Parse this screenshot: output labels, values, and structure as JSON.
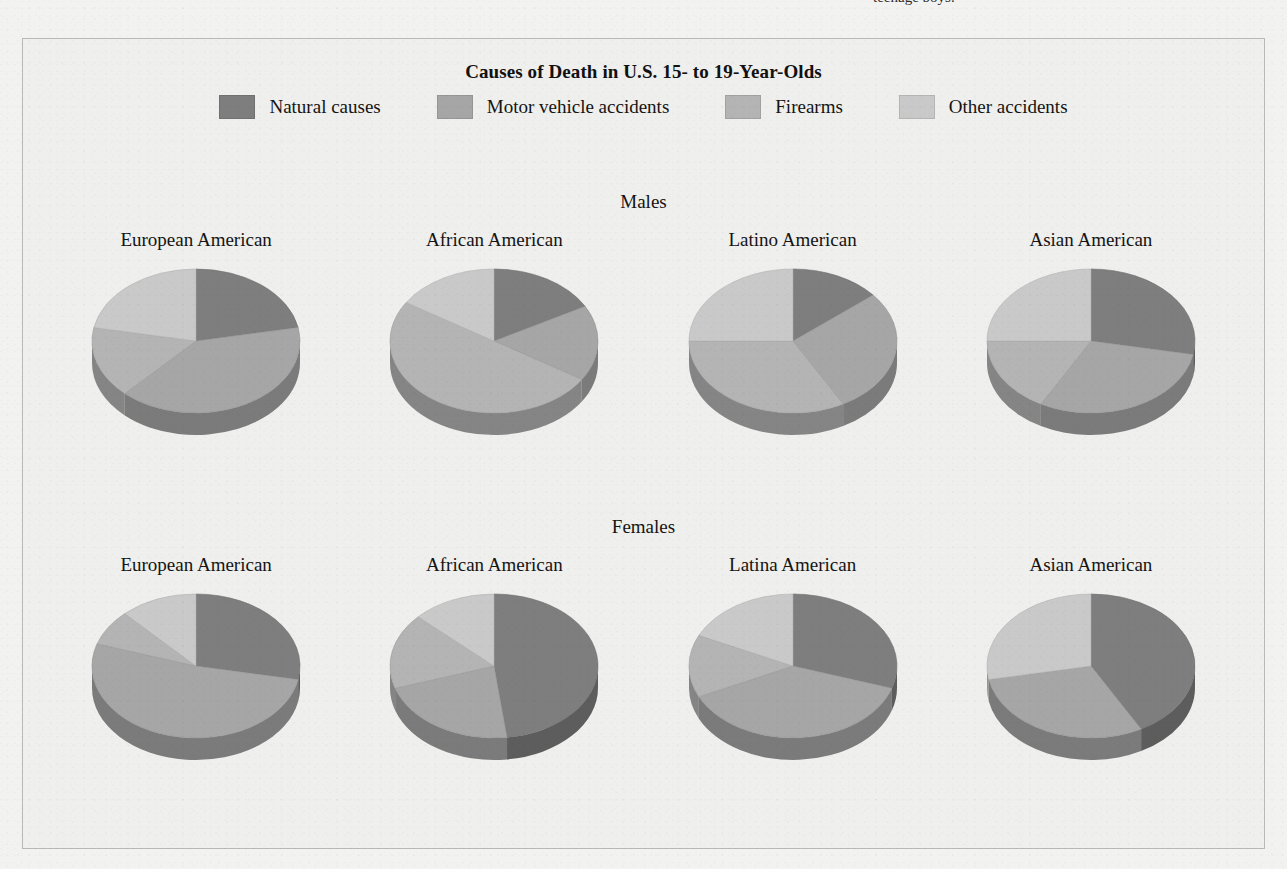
{
  "page": {
    "cut_off_caption": "teenage boys.",
    "background_color": "#f2f2f0",
    "panel_color": "#efefed"
  },
  "figure": {
    "title": "Causes of Death in U.S. 15- to 19-Year-Olds",
    "legend": [
      {
        "label": "Natural causes",
        "color": "#7e7e7e"
      },
      {
        "label": "Motor vehicle accidents",
        "color": "#a6a6a6"
      },
      {
        "label": "Firearms",
        "color": "#b4b4b4"
      },
      {
        "label": "Other accidents",
        "color": "#c9c9c9"
      }
    ],
    "sections": [
      {
        "name": "males",
        "heading": "Males"
      },
      {
        "name": "females",
        "heading": "Females"
      }
    ]
  },
  "chart_data": {
    "type": "pie",
    "title": "Causes of Death in U.S. 15- to 19-Year-Olds",
    "categories": [
      "Natural causes",
      "Motor vehicle accidents",
      "Firearms",
      "Other accidents"
    ],
    "colors": [
      "#7e7e7e",
      "#a6a6a6",
      "#b4b4b4",
      "#c9c9c9"
    ],
    "units": "percent",
    "note": "Each pie is a 3-D pie chart; slices ordered clockwise from 12 o'clock.",
    "panels": [
      {
        "group": "Males",
        "charts": [
          {
            "label": "European American",
            "values": [
              22,
              40,
              16,
              22
            ]
          },
          {
            "label": "African American",
            "values": [
              17,
              17,
              50,
              16
            ]
          },
          {
            "label": "Latino American",
            "values": [
              14,
              28,
              33,
              25
            ]
          },
          {
            "label": "Asian American",
            "values": [
              28,
              30,
              17,
              25
            ]
          }
        ]
      },
      {
        "group": "Females",
        "charts": [
          {
            "label": "European American",
            "values": [
              28,
              52,
              8,
              12
            ]
          },
          {
            "label": "African American",
            "values": [
              48,
              22,
              17,
              13
            ]
          },
          {
            "label": "Latina American",
            "values": [
              30,
              38,
              14,
              18
            ]
          },
          {
            "label": "Asian American",
            "values": [
              42,
              30,
              0,
              28
            ]
          }
        ]
      }
    ]
  }
}
